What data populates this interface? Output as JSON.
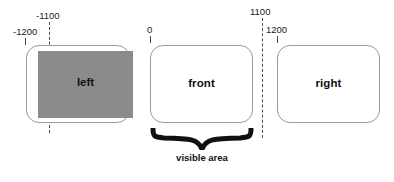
{
  "diagram": {
    "title_text": "",
    "background_color": "#ffffff",
    "shade_color": "#8b8b8b",
    "outline_color": "#9a9a9a",
    "guide_color": "#4a4a4a",
    "screens": [
      {
        "id": "left",
        "label": "left",
        "occluded": true
      },
      {
        "id": "front",
        "label": "front",
        "occluded": false
      },
      {
        "id": "right",
        "label": "right",
        "occluded": false
      }
    ],
    "axis_labels": {
      "minus1100": "-1100",
      "minus1200": "-1200",
      "zero": "0",
      "plus1100": "1100",
      "plus1200": "1200"
    },
    "annotation": {
      "visible_area": "visible area"
    }
  }
}
